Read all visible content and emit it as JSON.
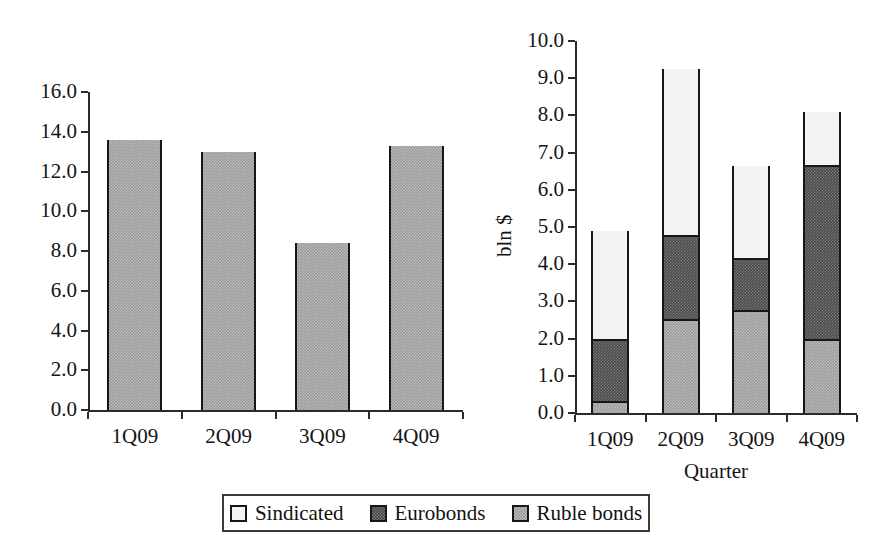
{
  "figure": {
    "background": "#ffffff",
    "series_colors": {
      "sindicated": "#f3f3f1",
      "eurobonds": "#4a4a4a",
      "ruble_bonds": "#9a9a9a",
      "outline": "#171717",
      "axis": "#2b2b2b"
    }
  },
  "legend": {
    "position": "bottom-center",
    "items": [
      {
        "label": "Sindicated",
        "key": "sindicated",
        "color": "#f3f3f1"
      },
      {
        "label": "Eurobonds",
        "key": "eurobonds",
        "color": "#4a4a4a"
      },
      {
        "label": "Ruble bonds",
        "key": "ruble_bonds",
        "color": "#9a9a9a"
      }
    ]
  },
  "chart_data": [
    {
      "id": "left-chart",
      "type": "bar",
      "title": "",
      "xlabel": "",
      "ylabel": "",
      "categories": [
        "1Q09",
        "2Q09",
        "3Q09",
        "4Q09"
      ],
      "values": [
        13.6,
        13.0,
        8.4,
        13.3
      ],
      "series": [
        {
          "name": "Ruble bonds",
          "values": [
            13.6,
            13.0,
            8.4,
            13.3
          ],
          "color": "#9a9a9a"
        }
      ],
      "ylim": [
        0.0,
        16.0
      ],
      "ytick_step": 2.0,
      "ytick_labels": [
        "0.0",
        "2.0",
        "4.0",
        "6.0",
        "8.0",
        "10.0",
        "12.0",
        "14.0",
        "16.0"
      ],
      "ytick_values": [
        0.0,
        2.0,
        4.0,
        6.0,
        8.0,
        10.0,
        12.0,
        14.0,
        16.0
      ],
      "grid": false,
      "legend": false
    },
    {
      "id": "right-chart",
      "type": "bar",
      "stacked": true,
      "title": "",
      "xlabel": "Quarter",
      "ylabel": "bln $",
      "categories": [
        "1Q09",
        "2Q09",
        "3Q09",
        "4Q09"
      ],
      "series": [
        {
          "name": "Ruble bonds",
          "values": [
            0.3,
            2.5,
            2.75,
            1.95
          ],
          "color": "#9a9a9a"
        },
        {
          "name": "Eurobonds",
          "values": [
            1.65,
            2.25,
            1.4,
            4.7
          ],
          "color": "#4a4a4a"
        },
        {
          "name": "Sindicated",
          "values": [
            2.95,
            4.5,
            2.5,
            1.45
          ],
          "color": "#f3f3f1"
        }
      ],
      "cumulative_tops": [
        {
          "category": "1Q09",
          "ruble_bonds": 0.3,
          "eurobonds": 1.95,
          "total": 4.9
        },
        {
          "category": "2Q09",
          "ruble_bonds": 2.5,
          "eurobonds": 4.75,
          "total": 9.25
        },
        {
          "category": "3Q09",
          "ruble_bonds": 2.75,
          "eurobonds": 4.15,
          "total": 6.65
        },
        {
          "category": "4Q09",
          "ruble_bonds": 1.95,
          "eurobonds": 6.65,
          "total": 8.1
        }
      ],
      "ylim": [
        0.0,
        10.0
      ],
      "ytick_step": 1.0,
      "ytick_labels": [
        "0.0",
        "1.0",
        "2.0",
        "3.0",
        "4.0",
        "5.0",
        "6.0",
        "7.0",
        "8.0",
        "9.0",
        "10.0"
      ],
      "ytick_values": [
        0.0,
        1.0,
        2.0,
        3.0,
        4.0,
        5.0,
        6.0,
        7.0,
        8.0,
        9.0,
        10.0
      ],
      "grid": false,
      "legend": false
    }
  ]
}
